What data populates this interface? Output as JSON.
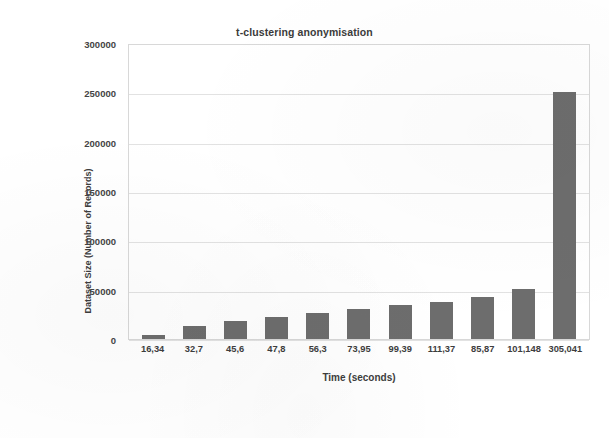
{
  "chart_data": {
    "type": "bar",
    "title": "t-clustering anonymisation",
    "xlabel": "Time (seconds)",
    "ylabel": "Dataset Size (Number of Records)",
    "categories": [
      "16,34",
      "32,7",
      "45,6",
      "47,8",
      "56,3",
      "73,95",
      "99,39",
      "111,37",
      "85,87",
      "101,148",
      "305,041"
    ],
    "values": [
      4000,
      13000,
      18000,
      22000,
      26000,
      30000,
      34000,
      38000,
      43000,
      51000,
      250000
    ],
    "ylim": [
      0,
      300000
    ],
    "ytick_labels": [
      "300000",
      "250000",
      "200000",
      "150000",
      "100000",
      "50000",
      "0"
    ],
    "ytick_values": [
      300000,
      250000,
      200000,
      150000,
      100000,
      50000,
      0
    ],
    "grid": true,
    "legend": false,
    "bar_color": "#6d6d6d",
    "grid_color": "#e2e2e2",
    "frame_color": "#d8d8d8",
    "background": "#ffffff"
  }
}
